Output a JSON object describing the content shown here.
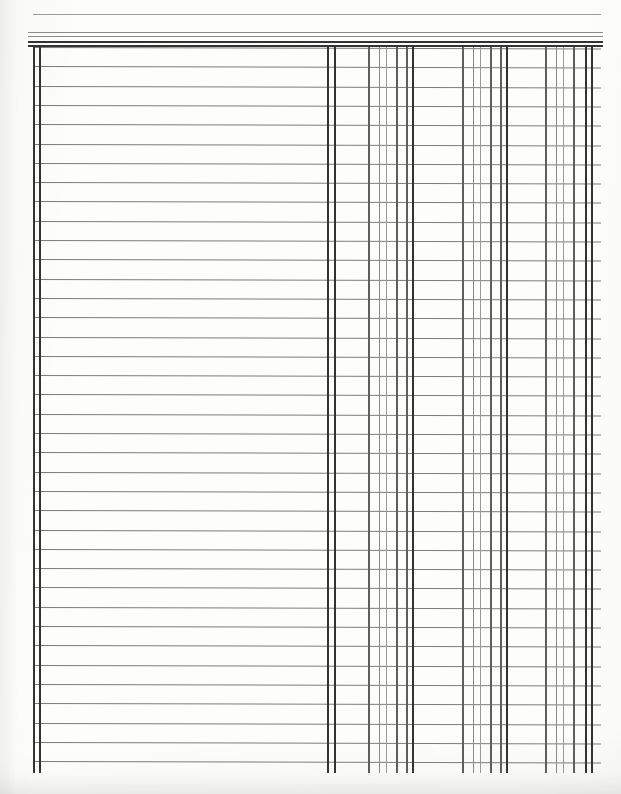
{
  "document": {
    "kind": "ledger-paper",
    "title": "Blank Accounting Ledger Sheet",
    "page_width": 621,
    "page_height": 794,
    "background_color": "#fdfdfc",
    "ink_color": "#5a5a5a",
    "heavy_ink_color": "#333333",
    "light_ink_color": "#9a9a9a"
  },
  "grid": {
    "description": "Pre-printed columnar accounting pad: wide description area at left, three money-column groups at right.",
    "row_count": 38,
    "row_spacing": 19.3,
    "first_row_y": 47,
    "last_row_y": 772,
    "rule_start_x": 33,
    "rule_end_x": 593,
    "header_rules": [
      {
        "y": 14,
        "thickness": 1,
        "weight": "w-hair",
        "x": 33,
        "width": 568
      },
      {
        "y": 32,
        "thickness": 1,
        "weight": "w-thin",
        "x": 28,
        "width": 575
      },
      {
        "y": 36,
        "thickness": 1,
        "weight": "w-thin",
        "x": 28,
        "width": 575
      },
      {
        "y": 41,
        "thickness": 2,
        "weight": "w-heavy",
        "x": 28,
        "width": 575
      },
      {
        "y": 45,
        "thickness": 2,
        "weight": "w-heavy",
        "x": 28,
        "width": 575
      }
    ],
    "vertical_lines": [
      {
        "x": 33,
        "width": 2,
        "weight": "w-heavy",
        "role": "left-margin-outer"
      },
      {
        "x": 39,
        "width": 2,
        "weight": "w-heavy",
        "role": "left-margin-inner"
      },
      {
        "x": 327,
        "width": 2,
        "weight": "w-heavy",
        "role": "money-area-divider-outer"
      },
      {
        "x": 334,
        "width": 2,
        "weight": "w-heavy",
        "role": "money-area-divider-inner"
      },
      {
        "x": 368,
        "width": 2,
        "weight": "w-med",
        "role": "group1-col1"
      },
      {
        "x": 379,
        "width": 1,
        "weight": "w-thin",
        "role": "group1-col2"
      },
      {
        "x": 386,
        "width": 1,
        "weight": "w-hair",
        "role": "group1-col3"
      },
      {
        "x": 396,
        "width": 2,
        "weight": "w-med",
        "role": "group1-col4"
      },
      {
        "x": 406,
        "width": 2,
        "weight": "w-med",
        "role": "group1-col5"
      },
      {
        "x": 412,
        "width": 2,
        "weight": "w-heavy",
        "role": "group1-end"
      },
      {
        "x": 462,
        "width": 2,
        "weight": "w-med",
        "role": "group2-col1"
      },
      {
        "x": 473,
        "width": 1,
        "weight": "w-thin",
        "role": "group2-col2"
      },
      {
        "x": 480,
        "width": 1,
        "weight": "w-hair",
        "role": "group2-col3"
      },
      {
        "x": 490,
        "width": 2,
        "weight": "w-med",
        "role": "group2-col4"
      },
      {
        "x": 500,
        "width": 2,
        "weight": "w-med",
        "role": "group2-col5"
      },
      {
        "x": 506,
        "width": 2,
        "weight": "w-heavy",
        "role": "group2-end"
      },
      {
        "x": 545,
        "width": 2,
        "weight": "w-med",
        "role": "group3-col1"
      },
      {
        "x": 556,
        "width": 1,
        "weight": "w-thin",
        "role": "group3-col2"
      },
      {
        "x": 563,
        "width": 1,
        "weight": "w-hair",
        "role": "group3-col3"
      },
      {
        "x": 573,
        "width": 2,
        "weight": "w-med",
        "role": "group3-col4"
      },
      {
        "x": 585,
        "width": 2,
        "weight": "w-heavy",
        "role": "right-margin-outer"
      },
      {
        "x": 591,
        "width": 2,
        "weight": "w-heavy",
        "role": "right-margin-inner"
      }
    ],
    "vertical_top_y": 47,
    "vertical_bottom_y": 773
  },
  "regions": {
    "description_column": {
      "label": "description-area",
      "x": 39,
      "width": 288
    },
    "money_groups": [
      {
        "label": "money-group-1",
        "x": 334,
        "width": 78
      },
      {
        "label": "money-group-2",
        "x": 412,
        "width": 94
      },
      {
        "label": "money-group-3",
        "x": 506,
        "width": 79
      }
    ]
  }
}
